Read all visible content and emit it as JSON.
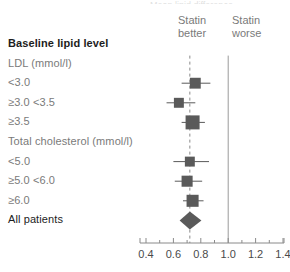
{
  "header": {
    "cut_title": "Mean lipid difference",
    "left_col_title": "Baseline lipid level",
    "better_line1": "Statin",
    "better_line2": "better",
    "worse_line1": "Statin",
    "worse_line2": "worse"
  },
  "colors": {
    "marker": "#5a5a5a",
    "axis": "#8a8a8a",
    "null_line": "#9a9a9a",
    "pooled_line": "#8a8a8a",
    "label": "#7a7a7a",
    "label_strong": "#1d1d1d"
  },
  "chart_data": {
    "type": "forest",
    "title": "Mean lipid difference",
    "xlabel": "",
    "ylabel": "",
    "xlim": [
      0.36,
      1.45
    ],
    "ticks": [
      "0.4",
      "0.6",
      "0.8",
      "1.0",
      "1.2",
      "1.4"
    ],
    "tick_values": [
      0.4,
      0.6,
      0.8,
      1.0,
      1.2,
      1.4
    ],
    "null_value": 1.0,
    "pooled_value": 0.72,
    "grid": false,
    "legend": [
      "Statin better",
      "Statin worse"
    ],
    "rows": [
      {
        "label": "Baseline lipid level",
        "kind": "heading"
      },
      {
        "label": "LDL (mmol/l)",
        "kind": "subheading"
      },
      {
        "label": "<3.0",
        "kind": "estimate",
        "value": 0.76,
        "ci_low": 0.66,
        "ci_high": 0.87,
        "weight": 0.55
      },
      {
        "label": "≥3.0 <3.5",
        "kind": "estimate",
        "value": 0.64,
        "ci_low": 0.55,
        "ci_high": 0.76,
        "weight": 0.42
      },
      {
        "label": "≥3.5",
        "kind": "estimate",
        "value": 0.74,
        "ci_low": 0.66,
        "ci_high": 0.83,
        "weight": 1.0
      },
      {
        "label": "Total cholesterol (mmol/l)",
        "kind": "subheading"
      },
      {
        "label": "<5.0",
        "kind": "estimate",
        "value": 0.72,
        "ci_low": 0.6,
        "ci_high": 0.86,
        "weight": 0.42
      },
      {
        "label": "≥5.0 <6.0",
        "kind": "estimate",
        "value": 0.7,
        "ci_low": 0.61,
        "ci_high": 0.81,
        "weight": 0.58
      },
      {
        "label": "≥6.0",
        "kind": "estimate",
        "value": 0.74,
        "ci_low": 0.67,
        "ci_high": 0.82,
        "weight": 0.72
      },
      {
        "label": "All patients",
        "kind": "summary",
        "value": 0.72,
        "ci_low": 0.66,
        "ci_high": 0.79
      }
    ]
  }
}
